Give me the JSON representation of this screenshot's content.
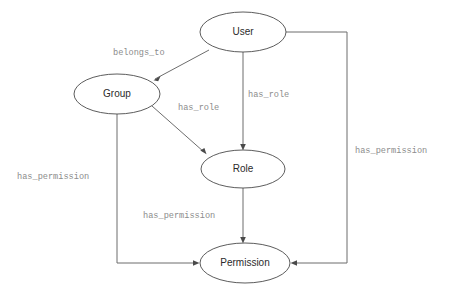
{
  "diagram": {
    "type": "entity-relationship-graph",
    "background_color": "#ffffff",
    "node_stroke_color": "#4a4a4a",
    "node_fill_color": "#ffffff",
    "node_label_color": "#2b2b2b",
    "edge_stroke_color": "#6d6d6d",
    "edge_label_color": "#8c8c8c",
    "nodes": [
      {
        "id": "user",
        "label": "User",
        "cx": 243,
        "cy": 32,
        "rx": 43,
        "ry": 20
      },
      {
        "id": "group",
        "label": "Group",
        "cx": 117,
        "cy": 94,
        "rx": 43,
        "ry": 20
      },
      {
        "id": "role",
        "label": "Role",
        "cx": 243,
        "cy": 169,
        "rx": 42,
        "ry": 19
      },
      {
        "id": "permission",
        "label": "Permission",
        "cx": 245,
        "cy": 263,
        "rx": 45,
        "ry": 20
      }
    ],
    "edges": [
      {
        "id": "user-group",
        "from": "user",
        "to": "group",
        "label": "belongs_to",
        "label_x": 113,
        "label_y": 53
      },
      {
        "id": "user-role",
        "from": "user",
        "to": "role",
        "label": "has_role",
        "label_x": 248,
        "label_y": 95
      },
      {
        "id": "group-role",
        "from": "group",
        "to": "role",
        "label": "has_role",
        "label_x": 178,
        "label_y": 108
      },
      {
        "id": "group-permission",
        "from": "group",
        "to": "permission",
        "label": "has_permission",
        "label_x": 17,
        "label_y": 177
      },
      {
        "id": "role-permission",
        "from": "role",
        "to": "permission",
        "label": "has_permission",
        "label_x": 143,
        "label_y": 216
      },
      {
        "id": "user-permission",
        "from": "user",
        "to": "permission",
        "label": "has_permission",
        "label_x": 355,
        "label_y": 151
      }
    ]
  }
}
